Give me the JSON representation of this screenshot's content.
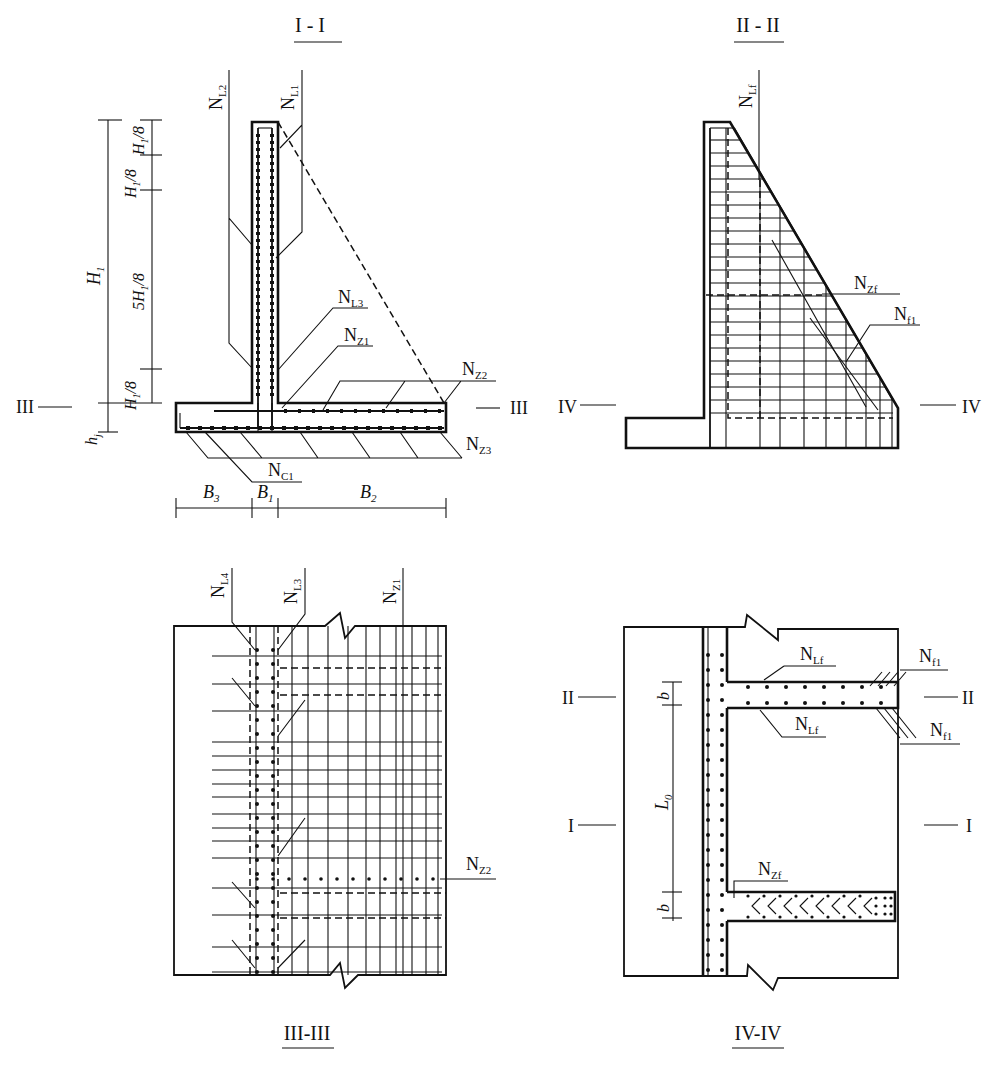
{
  "figure": {
    "panels": [
      {
        "id": "I-I",
        "title": "I - I",
        "description": "Cross section of cantilever retaining wall"
      },
      {
        "id": "II-II",
        "title": "II - II",
        "description": "Section through counterfort showing rebar mesh"
      },
      {
        "id": "III-III",
        "title": "III-III",
        "description": "Plan section through wall stem/base junction"
      },
      {
        "id": "IV-IV",
        "title": "IV-IV",
        "description": "Plan section showing counterforts"
      }
    ]
  },
  "section_1": {
    "title": "I - I",
    "rebar_labels": {
      "NL2": {
        "main": "N",
        "sub": "L2"
      },
      "NL1": {
        "main": "N",
        "sub": "L1"
      },
      "NL3": {
        "main": "N",
        "sub": "L3"
      },
      "NZ1": {
        "main": "N",
        "sub": "Z1"
      },
      "NZ2": {
        "main": "N",
        "sub": "Z2"
      },
      "NZ3": {
        "main": "N",
        "sub": "Z3"
      },
      "NC1": {
        "main": "N",
        "sub": "C1"
      }
    },
    "dimensions": {
      "H1": {
        "main": "H",
        "sub": "1"
      },
      "h_top1": {
        "main": "H",
        "sub": "1",
        "suffix": "/8"
      },
      "h_top2": {
        "main": "H",
        "sub": "1",
        "suffix": "/8"
      },
      "h_mid": {
        "prefix": "5",
        "main": "H",
        "sub": "1",
        "suffix": "/8"
      },
      "h_bot": {
        "main": "H",
        "sub": "1",
        "suffix": "/8"
      },
      "hj": {
        "main": "h",
        "sub": "j"
      },
      "B3": {
        "main": "B",
        "sub": "3"
      },
      "B1": {
        "main": "B",
        "sub": "1"
      },
      "B2": {
        "main": "B",
        "sub": "2"
      }
    },
    "cut_marks": {
      "left": "III",
      "right": "III"
    }
  },
  "section_2": {
    "title": "II - II",
    "rebar_labels": {
      "NLf": {
        "main": "N",
        "sub": "Lf"
      },
      "NZf": {
        "main": "N",
        "sub": "Zf"
      },
      "Nf1": {
        "main": "N",
        "sub": "f1"
      }
    },
    "cut_marks": {
      "left": "IV",
      "right": "IV"
    }
  },
  "section_3": {
    "title": "III-III",
    "rebar_labels": {
      "NL4": {
        "main": "N",
        "sub": "L4"
      },
      "NL3": {
        "main": "N",
        "sub": "L3"
      },
      "NZ1": {
        "main": "N",
        "sub": "Z1"
      },
      "NZ2": {
        "main": "N",
        "sub": "Z2"
      }
    }
  },
  "section_4": {
    "title": "IV-IV",
    "rebar_labels": {
      "NLf_top": {
        "main": "N",
        "sub": "Lf"
      },
      "NLf_bot": {
        "main": "N",
        "sub": "Lf"
      },
      "Nf1_top": {
        "main": "N",
        "sub": "f1"
      },
      "Nf1_bot": {
        "main": "N",
        "sub": "f1"
      },
      "NZf": {
        "main": "N",
        "sub": "Zf"
      }
    },
    "dimensions": {
      "b_top": {
        "main": "b"
      },
      "L0": {
        "main": "L",
        "sub": "0"
      },
      "b_bot": {
        "main": "b"
      }
    },
    "cut_marks": {
      "II_left": "II",
      "II_right": "II",
      "I_left": "I",
      "I_right": "I"
    }
  }
}
